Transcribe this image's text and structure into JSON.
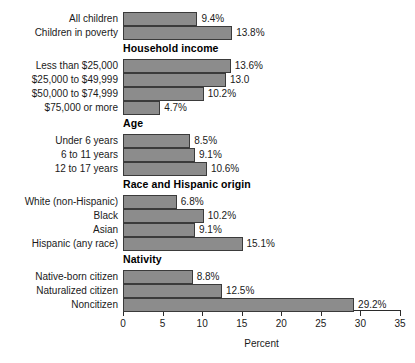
{
  "chart_data": {
    "type": "bar",
    "orientation": "horizontal",
    "title": "",
    "xlabel": "Percent",
    "ylabel": "",
    "xlim": [
      0,
      35
    ],
    "xticks": [
      0,
      5,
      10,
      15,
      20,
      25,
      30,
      35
    ],
    "xtick_labels": [
      "0",
      "5",
      "10",
      "15",
      "20",
      "25",
      "30",
      "35"
    ],
    "grid": false,
    "legend": null,
    "bar_color": "#8c8c8c",
    "bar_border_color": "#3b3b3b",
    "groups": [
      {
        "header": "",
        "items": [
          {
            "label": "All children",
            "value": 9.4,
            "value_label": "9.4%"
          },
          {
            "label": "Children in poverty",
            "value": 13.8,
            "value_label": "13.8%"
          }
        ]
      },
      {
        "header": "Household income",
        "items": [
          {
            "label": "Less than $25,000",
            "value": 13.6,
            "value_label": "13.6%"
          },
          {
            "label": "$25,000 to $49,999",
            "value": 13.0,
            "value_label": "13.0"
          },
          {
            "label": "$50,000 to $74,999",
            "value": 10.2,
            "value_label": "10.2%"
          },
          {
            "label": "$75,000 or more",
            "value": 4.7,
            "value_label": "4.7%"
          }
        ]
      },
      {
        "header": "Age",
        "items": [
          {
            "label": "Under 6 years",
            "value": 8.5,
            "value_label": "8.5%"
          },
          {
            "label": "6 to 11 years",
            "value": 9.1,
            "value_label": "9.1%"
          },
          {
            "label": "12 to 17 years",
            "value": 10.6,
            "value_label": "10.6%"
          }
        ]
      },
      {
        "header": "Race and Hispanic origin",
        "items": [
          {
            "label": "White (non-Hispanic)",
            "value": 6.8,
            "value_label": "6.8%"
          },
          {
            "label": "Black",
            "value": 10.2,
            "value_label": "10.2%"
          },
          {
            "label": "Asian",
            "value": 9.1,
            "value_label": "9.1%"
          },
          {
            "label": "Hispanic (any race)",
            "value": 15.1,
            "value_label": "15.1%"
          }
        ]
      },
      {
        "header": "Nativity",
        "items": [
          {
            "label": "Native-born citizen",
            "value": 8.8,
            "value_label": "8.8%"
          },
          {
            "label": "Naturalized citizen",
            "value": 12.5,
            "value_label": "12.5%"
          },
          {
            "label": "Noncitizen",
            "value": 29.2,
            "value_label": "29.2%"
          }
        ]
      }
    ]
  }
}
